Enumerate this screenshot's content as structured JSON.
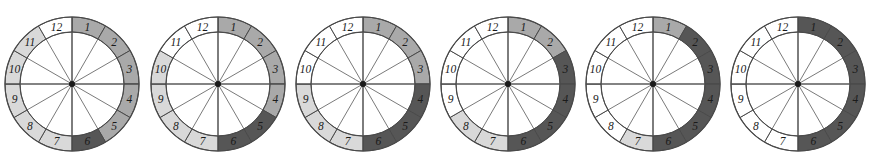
{
  "figure": {
    "type": "clock-segment-diagram-series",
    "count": 6,
    "segment_count_per_clock": 12,
    "segment_labels": [
      "1",
      "2",
      "3",
      "4",
      "5",
      "6",
      "7",
      "8",
      "9",
      "10",
      "11",
      "12"
    ],
    "geometry": {
      "centers_x": [
        72,
        218,
        363,
        508,
        653,
        798
      ],
      "center_y": 84,
      "outer_radius": 67,
      "inner_radius": 52,
      "hub_radius": 3,
      "label_radius": 59.5,
      "segment_angle_deg": 30,
      "segment_1_start_deg": -90
    },
    "colors": {
      "dark": "#565656",
      "medium": "#a9a9a9",
      "light": "#d9d9d9",
      "white": "#ffffff",
      "stroke": "#4a4a4a",
      "spoke": "#6b6b6b",
      "hub": "#1a1a1a",
      "label": "#1a1a1a",
      "background": "#ffffff"
    },
    "clocks": [
      {
        "index": 1,
        "name": "clock-1",
        "dark_segments": [
          6
        ],
        "medium_segments": [
          1,
          2,
          3,
          4,
          5
        ],
        "light_segments": [
          7,
          8,
          9,
          10,
          11
        ],
        "white_segments": [
          12
        ],
        "fills": [
          "medium",
          "medium",
          "medium",
          "medium",
          "medium",
          "dark",
          "light",
          "light",
          "light",
          "light",
          "light",
          "white"
        ]
      },
      {
        "index": 2,
        "name": "clock-2",
        "dark_segments": [
          5,
          6
        ],
        "medium_segments": [
          1,
          2,
          3,
          4
        ],
        "light_segments": [
          7,
          8,
          9,
          10
        ],
        "white_segments": [
          11,
          12
        ],
        "fills": [
          "medium",
          "medium",
          "medium",
          "medium",
          "dark",
          "dark",
          "light",
          "light",
          "light",
          "light",
          "white",
          "white"
        ]
      },
      {
        "index": 3,
        "name": "clock-3",
        "dark_segments": [
          4,
          5,
          6
        ],
        "medium_segments": [
          1,
          2,
          3
        ],
        "light_segments": [
          7,
          8,
          9
        ],
        "white_segments": [
          10,
          11,
          12
        ],
        "fills": [
          "medium",
          "medium",
          "medium",
          "dark",
          "dark",
          "dark",
          "light",
          "light",
          "light",
          "white",
          "white",
          "white"
        ]
      },
      {
        "index": 4,
        "name": "clock-4",
        "dark_segments": [
          3,
          4,
          5,
          6
        ],
        "medium_segments": [
          1,
          2
        ],
        "light_segments": [
          7,
          8
        ],
        "white_segments": [
          9,
          10,
          11,
          12
        ],
        "fills": [
          "medium",
          "medium",
          "dark",
          "dark",
          "dark",
          "dark",
          "light",
          "light",
          "white",
          "white",
          "white",
          "white"
        ]
      },
      {
        "index": 5,
        "name": "clock-5",
        "dark_segments": [
          2,
          3,
          4,
          5,
          6
        ],
        "medium_segments": [
          1
        ],
        "light_segments": [
          7
        ],
        "white_segments": [
          8,
          9,
          10,
          11,
          12
        ],
        "fills": [
          "medium",
          "dark",
          "dark",
          "dark",
          "dark",
          "dark",
          "light",
          "white",
          "white",
          "white",
          "white",
          "white"
        ]
      },
      {
        "index": 6,
        "name": "clock-6",
        "dark_segments": [
          1,
          2,
          3,
          4,
          5,
          6
        ],
        "medium_segments": [],
        "light_segments": [],
        "white_segments": [
          7,
          8,
          9,
          10,
          11,
          12
        ],
        "fills": [
          "dark",
          "dark",
          "dark",
          "dark",
          "dark",
          "dark",
          "white",
          "white",
          "white",
          "white",
          "white",
          "white"
        ]
      }
    ]
  }
}
